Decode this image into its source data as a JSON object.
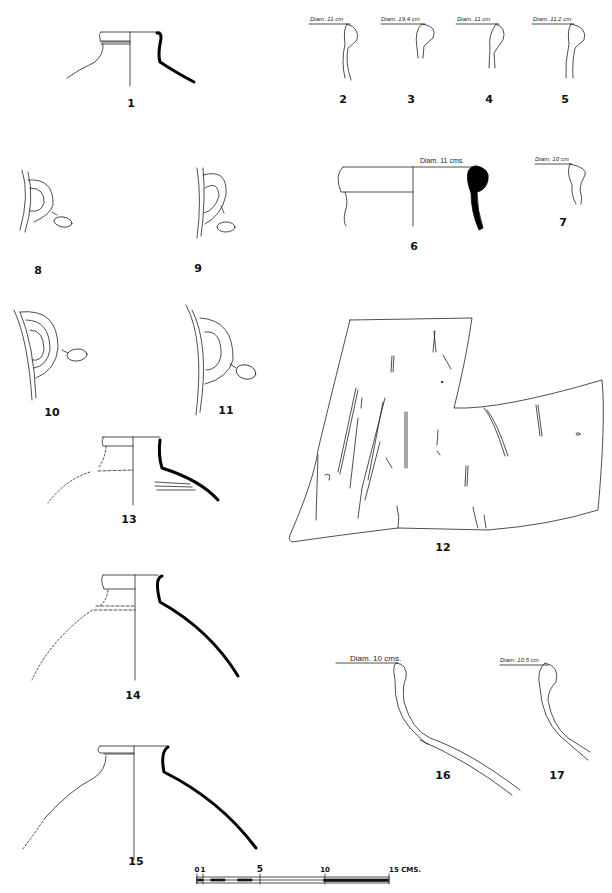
{
  "plate": {
    "type": "archaeological pottery drawing plate",
    "figures": [
      {
        "id": "1",
        "label": "1",
        "kind": "jar rim and shoulder profile"
      },
      {
        "id": "2",
        "label": "2",
        "kind": "rim profile",
        "diameter": "Diam. 11 cm"
      },
      {
        "id": "3",
        "label": "3",
        "kind": "rim profile",
        "diameter": "Diam. 19.4 cm"
      },
      {
        "id": "4",
        "label": "4",
        "kind": "rim profile",
        "diameter": "Diam. 11 cm"
      },
      {
        "id": "5",
        "label": "5",
        "kind": "rim profile",
        "diameter": "Diam. 11.2 cm"
      },
      {
        "id": "6",
        "label": "6",
        "kind": "rim profile (solid section)",
        "diameter": "Diam. 11 cms."
      },
      {
        "id": "7",
        "label": "7",
        "kind": "rim profile",
        "diameter": "Diam. 10 cm"
      },
      {
        "id": "8",
        "label": "8",
        "kind": "handle with section"
      },
      {
        "id": "9",
        "label": "9",
        "kind": "handle with section"
      },
      {
        "id": "10",
        "label": "10",
        "kind": "handle with section"
      },
      {
        "id": "11",
        "label": "11",
        "kind": "handle with section"
      },
      {
        "id": "12",
        "label": "12",
        "kind": "incised body sherd"
      },
      {
        "id": "13",
        "label": "13",
        "kind": "jar rim and shoulder profile"
      },
      {
        "id": "14",
        "label": "14",
        "kind": "jar rim and shoulder profile"
      },
      {
        "id": "15",
        "label": "15",
        "kind": "jar rim and shoulder profile"
      },
      {
        "id": "16",
        "label": "16",
        "kind": "rim and shoulder profile",
        "diameter": "Diam. 10 cms."
      },
      {
        "id": "17",
        "label": "17",
        "kind": "rim and shoulder profile",
        "diameter": "Diam. 10.5 cm"
      }
    ]
  },
  "scale_bar": {
    "ticks": [
      "0",
      "1",
      "5",
      "10",
      "15 CMS."
    ],
    "unit": "CMS."
  }
}
